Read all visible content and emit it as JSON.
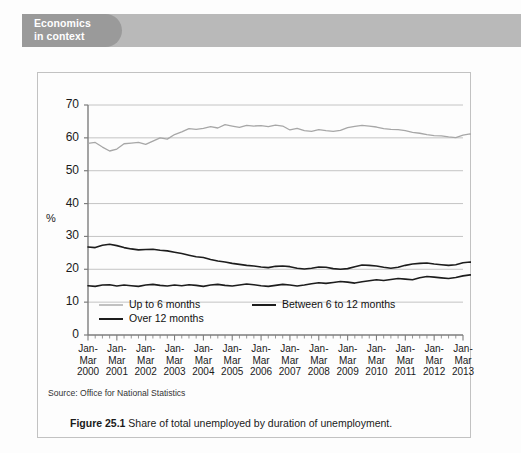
{
  "banner": {
    "label": "Economics\nin context"
  },
  "figure": {
    "caption_prefix": "Figure 25.1",
    "caption_text": " Share of total unemployed by duration of unemployment.",
    "source": "Source: Office for National Statistics"
  },
  "colors": {
    "banner_tab": "#9a9a9a",
    "banner_strip": "#b9b9b9",
    "series_light": "#a7a7a7",
    "series_dark": "#1d1d1d",
    "gridline": "#bdbdbd",
    "axis": "#7d7d7d",
    "box_border": "#c2c2c2",
    "page": "#fdfdfd"
  },
  "chart_data": {
    "type": "line",
    "title": "",
    "xlabel": "",
    "ylabel": "%",
    "ylim": [
      0,
      70
    ],
    "ytick_values": [
      0,
      10,
      20,
      30,
      40,
      50,
      60,
      70
    ],
    "grid": true,
    "legend_position": "bottom",
    "x_tick_labels": [
      "Jan-\nMar\n2000",
      "Jan-\nMar\n2001",
      "Jan-\nMar\n2002",
      "Jan-\nMar\n2003",
      "Jan-\nMar\n2004",
      "Jan-\nMar\n2005",
      "Jan-\nMar\n2006",
      "Jan-\nMar\n2007",
      "Jan-\nMar\n2008",
      "Jan-\nMar\n2009",
      "Jan-\nMar\n2010",
      "Jan-\nMar\n2011",
      "Jan-\nMar\n2012",
      "Jan-\nMar\n2013"
    ],
    "x_periods_per_year": 4,
    "x_start_year": 2000,
    "x_end_year": 2013,
    "series": [
      {
        "name": "Up to 6 months",
        "color": "#a7a7a7",
        "width": 1.3,
        "values": [
          58.3,
          58.6,
          57.2,
          56.0,
          56.6,
          58.2,
          58.4,
          58.6,
          58.0,
          59.0,
          60.0,
          59.6,
          61.0,
          61.8,
          62.8,
          62.6,
          62.9,
          63.4,
          63.0,
          64.0,
          63.6,
          63.2,
          63.8,
          63.6,
          63.7,
          63.4,
          63.9,
          63.6,
          62.4,
          62.9,
          62.2,
          62.0,
          62.5,
          62.2,
          62.0,
          62.3,
          63.1,
          63.5,
          63.8,
          63.6,
          63.3,
          62.8,
          62.6,
          62.5,
          62.2,
          61.7,
          61.4,
          61.0,
          60.7,
          60.6,
          60.3,
          60.1,
          60.8,
          61.2,
          60.8,
          60.6,
          61.2,
          61.6,
          62.0,
          61.6,
          59.5,
          56.5,
          53.5,
          51.2,
          49.6,
          48.8,
          48.2,
          48.6,
          49.4,
          49.3,
          49.8,
          50.3,
          49.4,
          49.6,
          49.0,
          47.4,
          47.0,
          47.2,
          47.6,
          47.4,
          47.7,
          48.0,
          48.3,
          48.6,
          48.5
        ]
      },
      {
        "name": "Between 6 to 12 months",
        "color": "#1d1d1d",
        "width": 1.6,
        "values": [
          26.8,
          26.6,
          27.3,
          27.6,
          27.2,
          26.6,
          26.2,
          25.9,
          26.0,
          26.1,
          25.8,
          25.6,
          25.2,
          24.8,
          24.3,
          23.8,
          23.6,
          23.0,
          22.5,
          22.2,
          21.8,
          21.5,
          21.2,
          21.0,
          20.7,
          20.5,
          20.9,
          21.0,
          20.8,
          20.3,
          20.1,
          20.3,
          20.7,
          20.6,
          20.2,
          20.0,
          20.2,
          20.8,
          21.3,
          21.2,
          21.0,
          20.6,
          20.3,
          20.6,
          21.2,
          21.6,
          21.8,
          21.9,
          21.6,
          21.4,
          21.2,
          21.4,
          22.0,
          22.2,
          22.0,
          21.8,
          21.9,
          21.7,
          21.5,
          21.8,
          22.6,
          23.9,
          24.2,
          23.4,
          24.0,
          22.4,
          21.1,
          20.4,
          20.2,
          20.1,
          20.0,
          20.2,
          20.6,
          21.0,
          20.8,
          20.2,
          19.4,
          19.6,
          19.9,
          19.4,
          18.9,
          19.4,
          19.6,
          19.3,
          18.6
        ]
      },
      {
        "name": "Over 12 months",
        "color": "#1d1d1d",
        "width": 1.6,
        "values": [
          15.0,
          14.8,
          15.2,
          15.3,
          14.9,
          15.2,
          15.0,
          14.8,
          15.2,
          15.4,
          15.1,
          14.9,
          15.2,
          15.0,
          15.3,
          15.1,
          14.8,
          15.2,
          15.4,
          15.1,
          14.9,
          15.2,
          15.5,
          15.3,
          15.0,
          14.8,
          15.1,
          15.4,
          15.2,
          14.9,
          15.2,
          15.6,
          15.9,
          15.7,
          16.0,
          16.3,
          16.1,
          15.8,
          16.2,
          16.5,
          16.8,
          16.6,
          16.9,
          17.2,
          17.0,
          16.8,
          17.4,
          17.8,
          17.6,
          17.4,
          17.2,
          17.5,
          18.0,
          18.3,
          18.1,
          17.9,
          18.2,
          18.0,
          17.8,
          18.6,
          19.8,
          21.8,
          24.8,
          27.6,
          29.8,
          31.2,
          32.3,
          32.4,
          32.2,
          32.8,
          33.0,
          32.6,
          32.2,
          33.0,
          34.0,
          34.6,
          34.4,
          34.0,
          34.6,
          35.4,
          35.8,
          36.0,
          36.6,
          37.0,
          36.8
        ]
      }
    ],
    "legend": [
      {
        "label": "Up to 6 months",
        "color": "#a7a7a7"
      },
      {
        "label": "Between 6 to 12 months",
        "color": "#1d1d1d"
      },
      {
        "label": "Over 12 months",
        "color": "#1d1d1d"
      }
    ]
  }
}
